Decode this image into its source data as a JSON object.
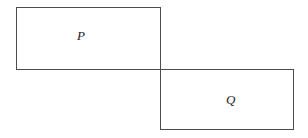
{
  "figure": {
    "type": "geometric-diagram",
    "background_color": "#ffffff",
    "stroke_color": "#4d4d4d",
    "label_color": "#1a1a1a",
    "canvas": {
      "width": 308,
      "height": 138
    },
    "shapes": [
      {
        "id": "P",
        "kind": "rectangle",
        "label": "P",
        "x": 16,
        "y": 7,
        "width": 145,
        "height": 63,
        "stroke": "#4d4d4d",
        "stroke_width": 1.3,
        "fill": "none",
        "label_x": 82,
        "label_y": 36
      },
      {
        "id": "Q",
        "kind": "rectangle",
        "label": "Q",
        "x": 160,
        "y": 69,
        "width": 134,
        "height": 61,
        "stroke": "#4d4d4d",
        "stroke_width": 1.3,
        "fill": "none",
        "label_x": 231,
        "label_y": 100
      }
    ],
    "shared_corner": {
      "x": 160,
      "y": 69
    }
  }
}
